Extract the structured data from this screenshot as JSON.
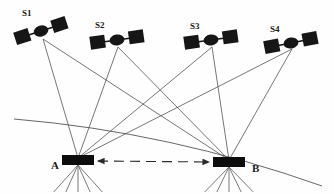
{
  "figure": {
    "kind": "satellite-positioning-geometry-diagram",
    "background_color": "#fefefe",
    "ink_color": "#161616",
    "ray_color": "#4a4a4a",
    "width": 334,
    "height": 194
  },
  "satellites": [
    {
      "id": "S1",
      "label": "S1",
      "label_x": 22,
      "label_y": 16,
      "hub_x": 41,
      "hub_y": 31,
      "signal_origin_x": 43,
      "signal_origin_y": 39,
      "tilt_deg": -18,
      "panel_left_x": 17,
      "panel_left_y": 30,
      "panel_right_x": 65,
      "panel_right_y": 22
    },
    {
      "id": "S2",
      "label": "S2",
      "label_x": 95,
      "label_y": 28,
      "hub_x": 117,
      "hub_y": 40,
      "signal_origin_x": 118,
      "signal_origin_y": 47,
      "tilt_deg": -8,
      "panel_left_x": 94,
      "panel_left_y": 41,
      "panel_right_x": 141,
      "panel_right_y": 36
    },
    {
      "id": "S3",
      "label": "S3",
      "label_x": 190,
      "label_y": 29,
      "hub_x": 211,
      "hub_y": 40,
      "signal_origin_x": 212,
      "signal_origin_y": 47,
      "tilt_deg": -8,
      "panel_left_x": 188,
      "panel_left_y": 42,
      "panel_right_x": 235,
      "panel_right_y": 36
    },
    {
      "id": "S4",
      "label": "S4",
      "label_x": 270,
      "label_y": 32,
      "hub_x": 291,
      "hub_y": 43,
      "signal_origin_x": 292,
      "signal_origin_y": 49,
      "tilt_deg": -11,
      "panel_left_x": 268,
      "panel_left_y": 46,
      "panel_right_x": 314,
      "panel_right_y": 37
    }
  ],
  "stations": [
    {
      "id": "A",
      "label": "A",
      "label_x": 51,
      "label_y": 169,
      "box_x": 62,
      "box_y": 155,
      "box_w": 32,
      "box_h": 10,
      "apex_x": 78,
      "apex_y": 158,
      "mast_base_y": 192
    },
    {
      "id": "B",
      "label": "B",
      "label_x": 252,
      "label_y": 172,
      "box_x": 213,
      "box_y": 157,
      "box_w": 32,
      "box_h": 10,
      "apex_x": 229,
      "apex_y": 160,
      "mast_base_y": 192
    }
  ],
  "signal_links": [
    {
      "from": "S1",
      "to": "A"
    },
    {
      "from": "S2",
      "to": "A"
    },
    {
      "from": "S3",
      "to": "A"
    },
    {
      "from": "S4",
      "to": "A"
    },
    {
      "from": "S1",
      "to": "B"
    },
    {
      "from": "S2",
      "to": "B"
    },
    {
      "from": "S3",
      "to": "B"
    },
    {
      "from": "S4",
      "to": "B"
    }
  ],
  "baseline": {
    "name": "baseline-A-B",
    "style": "dashed-double-headed-arrow",
    "from_x": 98,
    "from_y": 161,
    "to_x": 209,
    "to_y": 162,
    "dash_pattern": "10 6"
  },
  "horizon": {
    "name": "earth-horizon-arc",
    "start_x": 14,
    "start_y": 119,
    "control_x": 170,
    "control_y": 132,
    "end_x": 322,
    "end_y": 186
  }
}
